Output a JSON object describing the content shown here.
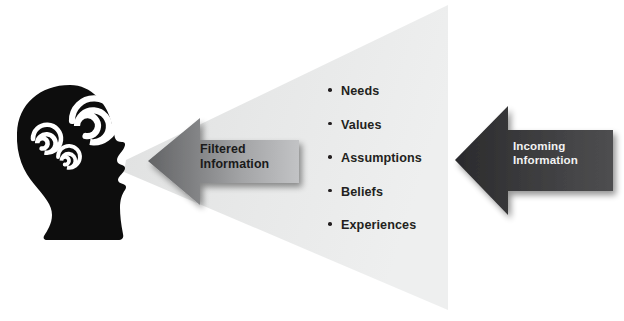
{
  "diagram": {
    "background_color": "#ffffff",
    "funnel": {
      "name": "perception-funnel",
      "fill_color": "#e8e9e9"
    },
    "head": {
      "name": "head-silhouette",
      "fill_color": "#0d0d0d",
      "spiral_color": "#ffffff",
      "spiral_count": 3
    },
    "filtered_arrow": {
      "label": "Filtered\nInformation",
      "label_line1": "Filtered",
      "label_line2": "Information",
      "direction": "left",
      "fill_start": "#6e6f71",
      "fill_end": "#b9babc",
      "text_color": "#1a1a1a"
    },
    "incoming_arrow": {
      "label": "Incoming\nInformation",
      "label_line1": "Incoming",
      "label_line2": "Information",
      "direction": "left",
      "fill_start": "#2e2e30",
      "fill_end": "#4a4a4c",
      "text_color": "#f2f2f2"
    },
    "filters": [
      {
        "label": "Needs"
      },
      {
        "label": "Values"
      },
      {
        "label": "Assumptions"
      },
      {
        "label": "Beliefs"
      },
      {
        "label": "Experiences"
      }
    ]
  }
}
